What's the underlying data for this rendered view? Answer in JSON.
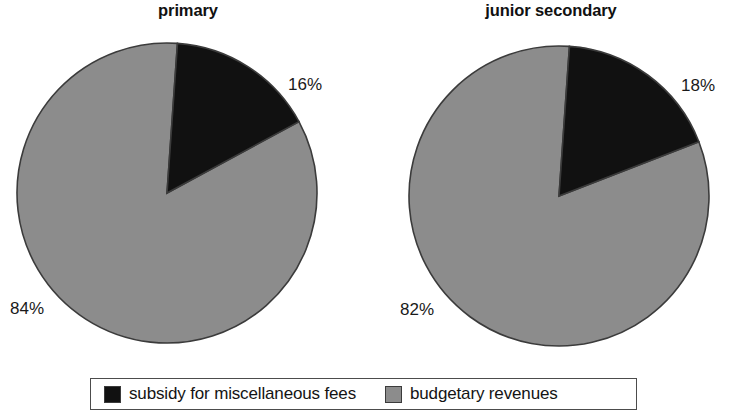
{
  "chart_data": {
    "type": "pie",
    "title": "",
    "charts": [
      {
        "title": "primary",
        "labels": [
          "subsidy for miscellaneous fees",
          "budgetary revenues"
        ],
        "values": [
          16,
          84
        ],
        "value_labels": [
          "16%",
          "84%"
        ],
        "colors": [
          "#111111",
          "#8c8c8c"
        ],
        "start_angle_deg": 4,
        "units": "percent"
      },
      {
        "title": "junior secondary",
        "labels": [
          "subsidy for miscellaneous fees",
          "budgetary revenues"
        ],
        "values": [
          18,
          82
        ],
        "value_labels": [
          "18%",
          "82%"
        ],
        "colors": [
          "#111111",
          "#8c8c8c"
        ],
        "start_angle_deg": 4,
        "units": "percent"
      }
    ],
    "legend": {
      "position": "bottom",
      "entries": [
        {
          "label": "subsidy for miscellaneous fees",
          "color": "#111111"
        },
        {
          "label": "budgetary revenues",
          "color": "#8c8c8c"
        }
      ]
    },
    "grid": false,
    "xlabel": "",
    "ylabel": ""
  },
  "panels": {
    "primary": {
      "title": "primary",
      "black_label": "16%",
      "gray_label": "84%"
    },
    "junior": {
      "title": "junior secondary",
      "black_label": "18%",
      "gray_label": "82%"
    }
  },
  "legend": {
    "subsidy_label": "subsidy for miscellaneous fees",
    "budget_label": "budgetary revenues"
  },
  "colors": {
    "black_slice": "#111111",
    "gray_slice": "#8c8c8c",
    "outline": "#3b3b3b",
    "background": "#ffffff"
  }
}
